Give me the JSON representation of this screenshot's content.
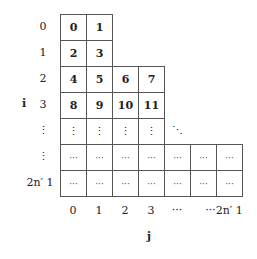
{
  "diagram": {
    "row_axis_label": "i",
    "col_axis_label": "j",
    "row_labels": [
      "0",
      "1",
      "2",
      "3",
      "⋮",
      "⋮",
      "2n′ 1"
    ],
    "col_labels": [
      "0",
      "1",
      "2",
      "3",
      "···",
      "···2n′ 1"
    ],
    "rows": [
      [
        "0",
        "1"
      ],
      [
        "2",
        "3"
      ],
      [
        "4",
        "5",
        "6",
        "7"
      ],
      [
        "8",
        "9",
        "10",
        "11"
      ],
      [
        "⋮",
        "⋮",
        "⋮",
        "⋮",
        "⋱"
      ],
      [
        "···",
        "···",
        "···",
        "···",
        "···",
        "···",
        "···"
      ],
      [
        "···",
        "···",
        "···",
        "···",
        "···",
        "···",
        "···"
      ]
    ]
  }
}
